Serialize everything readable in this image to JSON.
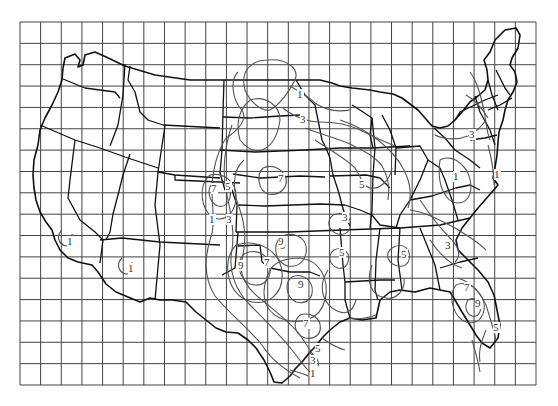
{
  "map": {
    "title": "",
    "type": "contour map of contiguous United States on grid",
    "grid": {
      "x0": 20,
      "y0": 22,
      "x1": 536,
      "y1": 385,
      "columns": 25,
      "rows": 17
    },
    "contour_labels": [
      {
        "value": "1",
        "x": 300,
        "y": 98
      },
      {
        "value": "3",
        "x": 303,
        "y": 123
      },
      {
        "value": "7",
        "x": 214,
        "y": 192
      },
      {
        "value": "5",
        "x": 228,
        "y": 190
      },
      {
        "value": "7",
        "x": 281,
        "y": 182
      },
      {
        "value": "5",
        "x": 362,
        "y": 188
      },
      {
        "value": "3",
        "x": 472,
        "y": 138
      },
      {
        "value": "1",
        "x": 497,
        "y": 178
      },
      {
        "value": "1",
        "x": 456,
        "y": 180
      },
      {
        "value": "1",
        "x": 212,
        "y": 223
      },
      {
        "value": "3",
        "x": 229,
        "y": 223
      },
      {
        "value": "1",
        "x": 70,
        "y": 245
      },
      {
        "value": "1",
        "x": 131,
        "y": 272
      },
      {
        "value": "9",
        "x": 241,
        "y": 269
      },
      {
        "value": "7",
        "x": 267,
        "y": 266
      },
      {
        "value": "9",
        "x": 283,
        "y": 249
      },
      {
        "value": "3",
        "x": 345,
        "y": 221
      },
      {
        "value": "5",
        "x": 342,
        "y": 256
      },
      {
        "value": "5",
        "x": 404,
        "y": 258
      },
      {
        "value": "3",
        "x": 448,
        "y": 249
      },
      {
        "value": "9",
        "x": 301,
        "y": 288
      },
      {
        "value": "9",
        "x": 281,
        "y": 245
      },
      {
        "value": "7",
        "x": 306,
        "y": 327
      },
      {
        "value": "5",
        "x": 318,
        "y": 352
      },
      {
        "value": "3",
        "x": 313,
        "y": 364
      },
      {
        "value": "1",
        "x": 313,
        "y": 377
      },
      {
        "value": "7",
        "x": 467,
        "y": 291
      },
      {
        "value": "9",
        "x": 478,
        "y": 307
      },
      {
        "value": "5",
        "x": 496,
        "y": 331
      }
    ]
  }
}
